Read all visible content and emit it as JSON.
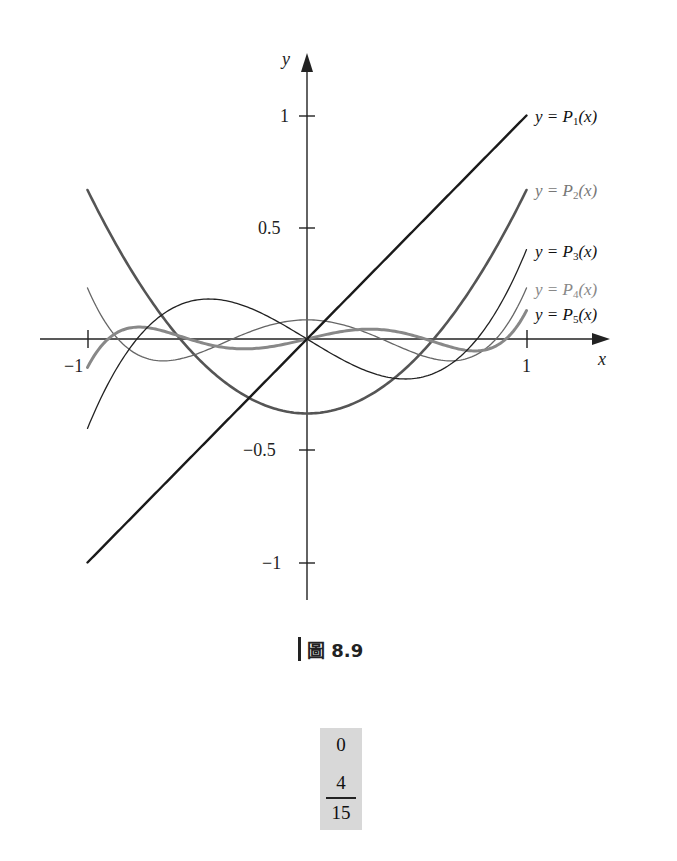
{
  "chart_data": {
    "type": "line",
    "title": "",
    "xlabel": "x",
    "ylabel": "y",
    "xlim": [
      -1,
      1
    ],
    "ylim": [
      -1,
      1
    ],
    "x_ticks": [
      {
        "value": -1,
        "label": "−1"
      },
      {
        "value": 1,
        "label": "1"
      }
    ],
    "y_ticks": [
      {
        "value": 1,
        "label": "1"
      },
      {
        "value": 0.5,
        "label": "0.5"
      },
      {
        "value": -0.5,
        "label": "−0.5"
      },
      {
        "value": -1,
        "label": "−1"
      }
    ],
    "grid": false,
    "legend_position": "right (inline curve labels)",
    "series": [
      {
        "name": "y = P1(x)",
        "index": "1",
        "formula": "x",
        "coeffs": [
          0,
          1
        ],
        "color": "#1a1a1a",
        "width": 2.4,
        "label_color": "#111111",
        "x": [
          -1,
          -0.5,
          0,
          0.5,
          1
        ],
        "values": [
          -1,
          -0.5,
          0,
          0.5,
          1
        ]
      },
      {
        "name": "y = P2(x)",
        "index": "2",
        "formula": "x^2 - 1/3",
        "coeffs": [
          -0.333333,
          0,
          1
        ],
        "color": "#555555",
        "width": 2.6,
        "label_color": "#777777",
        "x": [
          -1,
          -0.5,
          0,
          0.5,
          1
        ],
        "values": [
          0.667,
          -0.083,
          -0.333,
          -0.083,
          0.667
        ]
      },
      {
        "name": "y = P3(x)",
        "index": "3",
        "formula": "x^3 - 3x/5",
        "coeffs": [
          0,
          -0.6,
          0,
          1
        ],
        "color": "#222222",
        "width": 1.3,
        "label_color": "#111111",
        "x": [
          -1,
          -0.5,
          0,
          0.5,
          1
        ],
        "values": [
          -0.4,
          0.175,
          0,
          -0.175,
          0.4
        ]
      },
      {
        "name": "y = P4(x)",
        "index": "4",
        "formula": "x^4 - 6x^2/7 + 3/35",
        "coeffs": [
          0.085714,
          0,
          -0.857143,
          0,
          1
        ],
        "color": "#666666",
        "width": 1.3,
        "label_color": "#888888",
        "x": [
          -1,
          -0.5,
          0,
          0.5,
          1
        ],
        "values": [
          0.229,
          -0.066,
          0.086,
          -0.066,
          0.229
        ]
      },
      {
        "name": "y = P5(x)",
        "index": "5",
        "formula": "x^5 - 10x^3/9 + 5x/21",
        "coeffs": [
          0,
          0.238095,
          0,
          -1.111111,
          0,
          1
        ],
        "color": "#888888",
        "width": 3.0,
        "label_color": "#111111",
        "x": [
          -1,
          -0.5,
          0,
          0.5,
          1
        ],
        "values": [
          -0.127,
          0.0347,
          0,
          -0.0347,
          0.127
        ]
      }
    ]
  },
  "axes": {
    "x_label": "x",
    "y_label": "y",
    "origin_label": ""
  },
  "curve_labels": [
    {
      "prefix": "y = P",
      "sub": "1",
      "suffix": "(x)"
    },
    {
      "prefix": "y = P",
      "sub": "2",
      "suffix": "(x)"
    },
    {
      "prefix": "y = P",
      "sub": "3",
      "suffix": "(x)"
    },
    {
      "prefix": "y = P",
      "sub": "4",
      "suffix": "(x)"
    },
    {
      "prefix": "y = P",
      "sub": "5",
      "suffix": "(x)"
    }
  ],
  "caption": {
    "text": "圖 8.9"
  },
  "answer_box": {
    "value_top": "0",
    "numerator": "4",
    "denominator": "15"
  }
}
